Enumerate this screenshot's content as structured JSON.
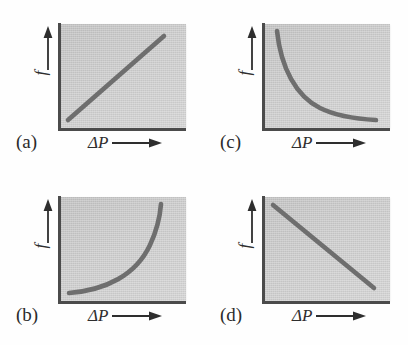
{
  "figure": {
    "title": "",
    "background_color": "#fefefe",
    "plot_fill_color": "#cdcdcd",
    "curve_color": "#6e6e6e",
    "axis_color": "#4b4b4b"
  },
  "chart_data": [
    {
      "type": "line",
      "panel": "(a)",
      "title": "",
      "xlabel": "ΔP",
      "ylabel": "f",
      "xlabel_arrow": "→",
      "ylabel_arrow": "↑",
      "grid": false,
      "legend": null,
      "xlim": [
        0,
        1
      ],
      "ylim": [
        0,
        1
      ],
      "relationship": "linear increasing",
      "x": [
        0.06,
        0.22,
        0.38,
        0.54,
        0.7,
        0.82
      ],
      "y": [
        0.08,
        0.26,
        0.44,
        0.62,
        0.8,
        0.92
      ]
    },
    {
      "type": "line",
      "panel": "(b)",
      "title": "",
      "xlabel": "ΔP",
      "ylabel": "f",
      "xlabel_arrow": "→",
      "ylabel_arrow": "↑",
      "grid": false,
      "legend": null,
      "xlim": [
        0,
        1
      ],
      "ylim": [
        0,
        1
      ],
      "relationship": "concave-up increasing (power law, exponent > 1)",
      "x": [
        0.07,
        0.25,
        0.42,
        0.56,
        0.67,
        0.74,
        0.8
      ],
      "y": [
        0.08,
        0.11,
        0.18,
        0.3,
        0.47,
        0.68,
        0.95
      ]
    },
    {
      "type": "line",
      "panel": "(c)",
      "title": "",
      "xlabel": "ΔP",
      "ylabel": "f",
      "xlabel_arrow": "→",
      "ylabel_arrow": "↑",
      "grid": false,
      "legend": null,
      "xlim": [
        0,
        1
      ],
      "ylim": [
        0,
        1
      ],
      "relationship": "decaying decreasing (asymptotic to horizontal)",
      "x": [
        0.1,
        0.17,
        0.27,
        0.4,
        0.56,
        0.72,
        0.88
      ],
      "y": [
        0.93,
        0.73,
        0.52,
        0.34,
        0.21,
        0.14,
        0.11
      ]
    },
    {
      "type": "line",
      "panel": "(d)",
      "title": "",
      "xlabel": "ΔP",
      "ylabel": "f",
      "xlabel_arrow": "→",
      "ylabel_arrow": "↑",
      "grid": false,
      "legend": null,
      "xlim": [
        0,
        1
      ],
      "ylim": [
        0,
        1
      ],
      "relationship": "linear decreasing",
      "x": [
        0.08,
        0.25,
        0.42,
        0.6,
        0.78,
        0.9
      ],
      "y": [
        0.94,
        0.78,
        0.6,
        0.42,
        0.24,
        0.13
      ]
    }
  ],
  "panels": {
    "a": {
      "letter": "(a)",
      "xlabel": "ΔP",
      "ylabel": "f",
      "path": "M 8 96 L 104 12"
    },
    "b": {
      "letter": "(b)",
      "xlabel": "ΔP",
      "ylabel": "f",
      "path": "M 9 96 C 46 93, 76 78, 90 48 C 97 33, 100 20, 101 7"
    },
    "c": {
      "letter": "(c)",
      "xlabel": "ΔP",
      "ylabel": "f",
      "path": "M 13 7 C 17 44, 32 72, 56 84 C 74 93, 94 95, 112 96"
    },
    "d": {
      "letter": "(d)",
      "xlabel": "ΔP",
      "ylabel": "f",
      "path": "M 9 8 L 110 91"
    }
  }
}
